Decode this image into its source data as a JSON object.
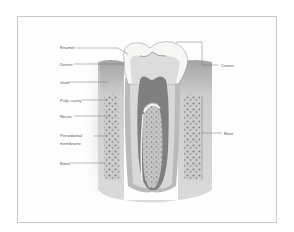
{
  "diagram": {
    "labels_left": [
      {
        "text": "Enamel",
        "y": 48
      },
      {
        "text": "Dentin",
        "y": 64
      },
      {
        "text": "Gum",
        "y": 82
      },
      {
        "text": "Pulp cavity",
        "y": 100
      },
      {
        "text": "Nerve",
        "y": 116
      },
      {
        "text": "Periodontal",
        "y": 135
      },
      {
        "text": "membrane",
        "y": 143
      },
      {
        "text": "Bone",
        "y": 163
      }
    ],
    "labels_right": [
      {
        "text": "Crown",
        "y": 65
      },
      {
        "text": "Root",
        "y": 133
      }
    ],
    "colors": {
      "frame": "#c9c9c9",
      "enamel": "#f8f8f6",
      "dentin": "#d9d9d9",
      "pulp": "#8c8c8c",
      "gum": "#bdbdbd",
      "bone": "#a9a9a9",
      "leader": "#777777"
    }
  }
}
